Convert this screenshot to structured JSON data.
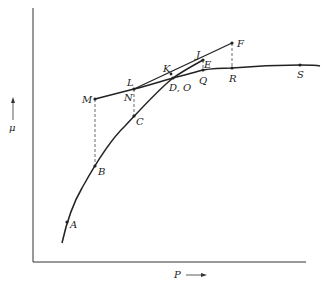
{
  "diagram": {
    "axes": {
      "x_label": "P",
      "y_label": "μ",
      "x_arrow": "right-arrow",
      "y_arrow": "up-arrow"
    },
    "points": {
      "A": "A",
      "B": "B",
      "C": "C",
      "DO": "D, O",
      "E": "E",
      "F": "F",
      "J": "J",
      "K": "K",
      "L": "L",
      "M": "M",
      "N": "N",
      "Q": "Q",
      "R": "R",
      "S": "S"
    },
    "colors": {
      "ink": "#222222",
      "background": "#ffffff"
    }
  }
}
